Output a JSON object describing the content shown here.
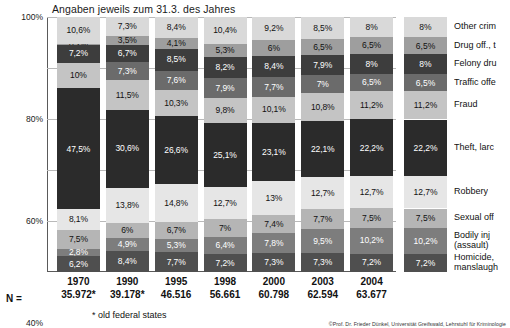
{
  "title": "Angaben jeweils zum 31.3. des Jahres",
  "n_prefix": "N =",
  "footnote": "* old federal states",
  "credit": "©Prof. Dr. Frieder Dünkel, Universität Greifswald, Lehrstuhl für Kriminologie",
  "axis": {
    "yticks": [
      "100%",
      "80%",
      "60%",
      "40%",
      "20%",
      "0%"
    ],
    "ytick_values": [
      100,
      80,
      60,
      40,
      20,
      0
    ]
  },
  "colors": {
    "other_crimes": "#d9d9d9",
    "drug_off": "#9e9e9e",
    "felony_drug": "#3d3d3d",
    "traffic_off": "#6b6b6b",
    "fraud": "#c4c4c4",
    "theft": "#2b2b2b",
    "robbery": "#e6e6e6",
    "sexual_off": "#b5b5b5",
    "bodily_injury": "#7d7d7d",
    "homicide": "#4f4f4f",
    "plot_border": "#5a5a5a",
    "gridline": "#b9b9b9"
  },
  "chart_data": {
    "type": "bar",
    "title": "Angaben jeweils zum 31.3. des Jahres",
    "xlabel": "",
    "ylabel": "",
    "ylim": [
      0,
      100
    ],
    "grid": true,
    "stacked": true,
    "legend_position": "right",
    "categories": [
      "1970",
      "1990",
      "1995",
      "1998",
      "2000",
      "2003",
      "2004"
    ],
    "n_values": [
      "35.972*",
      "39.178*",
      "46.516",
      "56.661",
      "60.798",
      "62.594",
      "63.677"
    ],
    "series": [
      {
        "name": "Other crimes",
        "key": "other_crimes",
        "values": [
          10.6,
          7.3,
          8.4,
          10.4,
          9.2,
          8.5,
          8.0
        ],
        "labels": [
          "10,6%",
          "7,3%",
          "8,4%",
          "10,4%",
          "9,2%",
          "8,5%",
          "8%"
        ]
      },
      {
        "name": "Drug off., trafficking",
        "key": "drug_off",
        "values": [
          0.2,
          3.5,
          4.1,
          5.3,
          6.0,
          6.5,
          6.5
        ],
        "labels": [
          "0,2%",
          "3,5%",
          "4,1%",
          "5,3%",
          "6%",
          "6,5%",
          "6,5%"
        ]
      },
      {
        "name": "Felony drunken driving",
        "key": "felony_drug",
        "values": [
          7.2,
          6.7,
          8.5,
          8.2,
          8.4,
          7.9,
          8.0
        ],
        "labels": [
          "7,2%",
          "6,7%",
          "8,5%",
          "8,2%",
          "8,4%",
          "7,9%",
          "8%"
        ]
      },
      {
        "name": "Traffic offences",
        "key": "traffic_off",
        "values": [
          0.0,
          7.3,
          7.6,
          7.9,
          7.7,
          7.0,
          6.5
        ],
        "labels": [
          "",
          "7,3%",
          "7,6%",
          "7,9%",
          "7,7%",
          "7%",
          "6,5%"
        ]
      },
      {
        "name": "Fraud",
        "key": "fraud",
        "values": [
          10.0,
          11.5,
          10.3,
          9.8,
          10.1,
          10.8,
          11.2
        ],
        "labels": [
          "10%",
          "11,5%",
          "10,3%",
          "9,8%",
          "10,1%",
          "10,8%",
          "11,2%"
        ]
      },
      {
        "name": "Theft, larceny",
        "key": "theft",
        "values": [
          47.5,
          30.6,
          26.6,
          25.1,
          23.1,
          22.1,
          22.2
        ],
        "labels": [
          "47,5%",
          "30,6%",
          "26,6%",
          "25,1%",
          "23,1%",
          "22,1%",
          "22,2%"
        ]
      },
      {
        "name": "Robbery",
        "key": "robbery",
        "values": [
          8.1,
          13.8,
          14.8,
          12.7,
          13.0,
          12.7,
          12.7
        ],
        "labels": [
          "8,1%",
          "13,8%",
          "14,8%",
          "12,7%",
          "13%",
          "12,7%",
          "12,7%"
        ]
      },
      {
        "name": "Sexual offences",
        "key": "sexual_off",
        "values": [
          7.5,
          6.0,
          6.7,
          7.0,
          7.4,
          7.7,
          7.5
        ],
        "labels": [
          "7,5%",
          "6%",
          "6,7%",
          "7%",
          "7,4%",
          "7,7%",
          "7,5%"
        ]
      },
      {
        "name": "Bodily injury (assault)",
        "key": "bodily_injury",
        "values": [
          2.8,
          4.9,
          5.3,
          6.4,
          7.8,
          9.5,
          10.2
        ],
        "labels": [
          "2,8%",
          "4,9%",
          "5,3%",
          "6,4%",
          "7,8%",
          "9,5%",
          "10,2%"
        ]
      },
      {
        "name": "Homicide, manslaughter",
        "key": "homicide",
        "values": [
          6.2,
          8.4,
          7.7,
          7.2,
          7.3,
          7.3,
          7.2
        ],
        "labels": [
          "6,2%",
          "8,4%",
          "7,7%",
          "7,2%",
          "7,3%",
          "7,3%",
          "7,2%"
        ]
      }
    ]
  },
  "legend": {
    "items": [
      {
        "label": "Other crim",
        "key": "other_crimes",
        "swatch_label": "8%"
      },
      {
        "label": "Drug off., t",
        "key": "drug_off",
        "swatch_label": "6,5%"
      },
      {
        "label": "Felony dru",
        "key": "felony_drug",
        "swatch_label": "8%"
      },
      {
        "label": "Traffic offe",
        "key": "traffic_off",
        "swatch_label": "6,5%"
      },
      {
        "label": "Fraud",
        "key": "fraud",
        "swatch_label": "11,2%"
      },
      {
        "label": "Theft, larc",
        "key": "theft",
        "swatch_label": "22,2%"
      },
      {
        "label": "Robbery",
        "key": "robbery",
        "swatch_label": "12,7%"
      },
      {
        "label": "Sexual off",
        "key": "sexual_off",
        "swatch_label": "7,5%"
      },
      {
        "label": "Bodily inj\n(assault)",
        "key": "bodily_injury",
        "swatch_label": "10,2%"
      },
      {
        "label": "Homicide,\nmanslaugh",
        "key": "homicide",
        "swatch_label": "7,2%"
      }
    ]
  }
}
